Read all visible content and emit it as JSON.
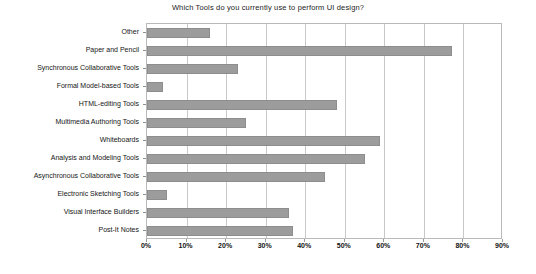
{
  "chart_data": {
    "type": "bar",
    "orientation": "horizontal",
    "title": "Which Tools do you currently use to perform UI design?",
    "xlabel": "",
    "ylabel": "",
    "xlim": [
      0,
      90
    ],
    "xtick_labels": [
      "0%",
      "10%",
      "20%",
      "30%",
      "40%",
      "50%",
      "60%",
      "70%",
      "80%",
      "90%"
    ],
    "xtick_values": [
      0,
      10,
      20,
      30,
      40,
      50,
      60,
      70,
      80,
      90
    ],
    "grid": true,
    "legend": false,
    "bar_color": "#9c9c9c",
    "plot_border_color": "#b9b9b9",
    "gridline_color": "#c9c9c9",
    "categories": [
      "Other",
      "Paper and Pencil",
      "Synchronous Collaborative Tools",
      "Formal Model-based Tools",
      "HTML-editing Tools",
      "Multimedia Authoring Tools",
      "Whiteboards",
      "Analysis and Modeling Tools",
      "Asynchronous Collaborative Tools",
      "Electronic Sketching Tools",
      "Visual Interface Builders",
      "Post-It Notes"
    ],
    "values": [
      16,
      77,
      23,
      4,
      48,
      25,
      59,
      55,
      45,
      5,
      36,
      37
    ]
  }
}
